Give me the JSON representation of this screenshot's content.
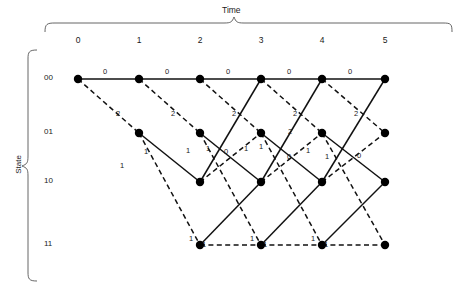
{
  "figure": {
    "type": "trellis-diagram",
    "x_axis_title": "Time",
    "y_axis_title": "State",
    "time_ticks": [
      "0",
      "1",
      "2",
      "3",
      "4",
      "5"
    ],
    "state_labels": [
      "00",
      "01",
      "10",
      "11"
    ],
    "legend": {
      "solid_meaning": "input 0",
      "dashed_meaning": "input 1"
    },
    "colors": {
      "line": "#111111",
      "node": "#000000",
      "background": "#ffffff",
      "text": "#1a1a1a"
    },
    "geometry": {
      "time_x": [
        78,
        139,
        200,
        261,
        322,
        385
      ],
      "state_y": [
        79,
        133,
        182,
        245
      ],
      "node_radius": 4.2
    },
    "nodes": [
      {
        "t": 0,
        "s": 0
      },
      {
        "t": 1,
        "s": 0
      },
      {
        "t": 2,
        "s": 0
      },
      {
        "t": 3,
        "s": 0
      },
      {
        "t": 4,
        "s": 0
      },
      {
        "t": 5,
        "s": 0
      },
      {
        "t": 1,
        "s": 1
      },
      {
        "t": 2,
        "s": 1
      },
      {
        "t": 3,
        "s": 1
      },
      {
        "t": 4,
        "s": 1
      },
      {
        "t": 5,
        "s": 1
      },
      {
        "t": 2,
        "s": 2
      },
      {
        "t": 3,
        "s": 2
      },
      {
        "t": 4,
        "s": 2
      },
      {
        "t": 5,
        "s": 2
      },
      {
        "t": 2,
        "s": 3
      },
      {
        "t": 3,
        "s": 3
      },
      {
        "t": 4,
        "s": 3
      },
      {
        "t": 5,
        "s": 3
      }
    ],
    "edges": [
      {
        "t": 0,
        "from": 0,
        "to": 0,
        "style": "solid",
        "metric": "0"
      },
      {
        "t": 0,
        "from": 0,
        "to": 1,
        "style": "dashed",
        "metric": "2"
      },
      {
        "t": 1,
        "from": 0,
        "to": 0,
        "style": "solid",
        "metric": "0"
      },
      {
        "t": 1,
        "from": 0,
        "to": 1,
        "style": "dashed",
        "metric": "2"
      },
      {
        "t": 1,
        "from": 1,
        "to": 2,
        "style": "solid",
        "metric": "1"
      },
      {
        "t": 1,
        "from": 1,
        "to": 3,
        "style": "dashed",
        "metric": "1"
      },
      {
        "t": 2,
        "from": 0,
        "to": 0,
        "style": "solid",
        "metric": "0"
      },
      {
        "t": 2,
        "from": 0,
        "to": 1,
        "style": "dashed",
        "metric": "2"
      },
      {
        "t": 2,
        "from": 1,
        "to": 2,
        "style": "solid",
        "metric": "1"
      },
      {
        "t": 2,
        "from": 1,
        "to": 3,
        "style": "dashed",
        "metric": "1"
      },
      {
        "t": 2,
        "from": 2,
        "to": 0,
        "style": "solid",
        "metric": "1"
      },
      {
        "t": 2,
        "from": 2,
        "to": 1,
        "style": "dashed",
        "metric": "1"
      },
      {
        "t": 2,
        "from": 3,
        "to": 2,
        "style": "solid",
        "metric": "0"
      },
      {
        "t": 2,
        "from": 3,
        "to": 3,
        "style": "dashed",
        "metric": "1"
      },
      {
        "t": 3,
        "from": 0,
        "to": 0,
        "style": "solid",
        "metric": "0"
      },
      {
        "t": 3,
        "from": 0,
        "to": 1,
        "style": "dashed",
        "metric": "2"
      },
      {
        "t": 3,
        "from": 1,
        "to": 2,
        "style": "solid",
        "metric": "1"
      },
      {
        "t": 3,
        "from": 1,
        "to": 3,
        "style": "dashed",
        "metric": "1"
      },
      {
        "t": 3,
        "from": 2,
        "to": 0,
        "style": "solid",
        "metric": "1"
      },
      {
        "t": 3,
        "from": 2,
        "to": 1,
        "style": "dashed",
        "metric": "2"
      },
      {
        "t": 3,
        "from": 3,
        "to": 2,
        "style": "solid",
        "metric": "0"
      },
      {
        "t": 3,
        "from": 3,
        "to": 3,
        "style": "dashed",
        "metric": "1"
      },
      {
        "t": 4,
        "from": 0,
        "to": 0,
        "style": "solid",
        "metric": "0"
      },
      {
        "t": 4,
        "from": 0,
        "to": 1,
        "style": "dashed",
        "metric": "2"
      },
      {
        "t": 4,
        "from": 1,
        "to": 2,
        "style": "solid",
        "metric": "1"
      },
      {
        "t": 4,
        "from": 1,
        "to": 3,
        "style": "dashed",
        "metric": "1"
      },
      {
        "t": 4,
        "from": 2,
        "to": 0,
        "style": "solid",
        "metric": "1"
      },
      {
        "t": 4,
        "from": 2,
        "to": 1,
        "style": "dashed",
        "metric": "0"
      },
      {
        "t": 4,
        "from": 3,
        "to": 2,
        "style": "solid",
        "metric": "0"
      },
      {
        "t": 4,
        "from": 3,
        "to": 3,
        "style": "dashed",
        "metric": "1"
      }
    ],
    "metric_labels": [
      {
        "text": "0",
        "x": 103,
        "y": 68
      },
      {
        "text": "0",
        "x": 165,
        "y": 68
      },
      {
        "text": "0",
        "x": 226,
        "y": 68
      },
      {
        "text": "0",
        "x": 287,
        "y": 68
      },
      {
        "text": "0",
        "x": 348,
        "y": 68
      },
      {
        "text": "2",
        "x": 116,
        "y": 110
      },
      {
        "text": "2",
        "x": 171,
        "y": 110
      },
      {
        "text": "2",
        "x": 232,
        "y": 110
      },
      {
        "text": "2",
        "x": 293,
        "y": 110
      },
      {
        "text": "2",
        "x": 354,
        "y": 110
      },
      {
        "text": "1",
        "x": 144,
        "y": 148
      },
      {
        "text": "1",
        "x": 120,
        "y": 162
      },
      {
        "text": "1",
        "x": 186,
        "y": 147
      },
      {
        "text": "1",
        "x": 206,
        "y": 145
      },
      {
        "text": "0",
        "x": 224,
        "y": 148
      },
      {
        "text": "1",
        "x": 244,
        "y": 145
      },
      {
        "text": "1",
        "x": 259,
        "y": 143
      },
      {
        "text": "2",
        "x": 288,
        "y": 128
      },
      {
        "text": "0",
        "x": 287,
        "y": 153
      },
      {
        "text": "1",
        "x": 306,
        "y": 147
      },
      {
        "text": "1",
        "x": 325,
        "y": 153
      },
      {
        "text": "0",
        "x": 357,
        "y": 152
      },
      {
        "text": "1",
        "x": 189,
        "y": 235
      },
      {
        "text": "1",
        "x": 202,
        "y": 241
      },
      {
        "text": "1",
        "x": 250,
        "y": 235
      },
      {
        "text": "1",
        "x": 263,
        "y": 241
      },
      {
        "text": "1",
        "x": 311,
        "y": 235
      },
      {
        "text": "1",
        "x": 324,
        "y": 241
      }
    ]
  }
}
